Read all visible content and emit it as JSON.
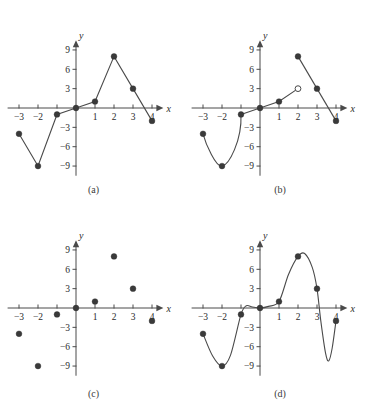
{
  "figure": {
    "background": "#ffffff",
    "marker_color": "#3a3a3a",
    "curve_color": "#4a4a4a",
    "axis_color": "#4a4a4a"
  },
  "axis": {
    "x_label": "x",
    "y_label": "y",
    "x_ticks": [
      "−3",
      "−2",
      "",
      "",
      "1",
      "2",
      "3",
      "4"
    ],
    "x_tick_values": [
      -3,
      -2,
      -1,
      0,
      1,
      2,
      3,
      4
    ],
    "y_ticks": [
      "9",
      "6",
      "3",
      "−3",
      "−6",
      "−9"
    ],
    "y_tick_values": [
      9,
      6,
      3,
      -3,
      -6,
      -9
    ],
    "xlim": [
      -3.6,
      4.6
    ],
    "ylim": [
      -10.5,
      10.5
    ],
    "grid": false
  },
  "panels": [
    {
      "id": "a",
      "caption": "(a)",
      "type": "line",
      "description": "points joined by straight line segments"
    },
    {
      "id": "b",
      "caption": "(b)",
      "type": "line",
      "description": "piecewise: smooth curve left, line to open circle, separate line segment right"
    },
    {
      "id": "c",
      "caption": "(c)",
      "type": "scatter",
      "description": "data points only, no connecting lines"
    },
    {
      "id": "d",
      "caption": "(d)",
      "type": "line",
      "description": "single smooth spline through all points"
    }
  ],
  "chart_data": [
    {
      "type": "line",
      "panel": "a",
      "title": "(a)",
      "xlabel": "x",
      "ylabel": "y",
      "x": [
        -3,
        -2,
        -1,
        0,
        1,
        2,
        3,
        4
      ],
      "values": [
        -4,
        -9,
        -1,
        0,
        1,
        8,
        3,
        -2
      ],
      "xlim": [
        -3.6,
        4.6
      ],
      "ylim": [
        -10.5,
        10.5
      ],
      "grid": false,
      "markers": true,
      "connected": true
    },
    {
      "type": "line",
      "panel": "b",
      "title": "(b)",
      "xlabel": "x",
      "ylabel": "y",
      "x": [
        -3,
        -2,
        -1,
        0,
        1,
        2,
        3,
        4
      ],
      "values": [
        -4,
        -9,
        -1,
        0,
        1,
        8,
        3,
        -2
      ],
      "xlim": [
        -3.6,
        4.6
      ],
      "ylim": [
        -10.5,
        10.5
      ],
      "grid": false,
      "markers": true,
      "connected": true,
      "open_circle": {
        "x": 2,
        "y": 3
      },
      "segments": [
        {
          "kind": "curve",
          "points": [
            [
              -3,
              -4
            ],
            [
              -2,
              -9
            ],
            [
              -1,
              -1
            ]
          ]
        },
        {
          "kind": "line",
          "points": [
            [
              -1,
              -1
            ],
            [
              0,
              0
            ],
            [
              1,
              1
            ],
            [
              2,
              3
            ]
          ]
        },
        {
          "kind": "line",
          "points": [
            [
              2,
              8
            ],
            [
              3,
              3
            ],
            [
              4,
              -2
            ]
          ]
        }
      ]
    },
    {
      "type": "scatter",
      "panel": "c",
      "title": "(c)",
      "xlabel": "x",
      "ylabel": "y",
      "x": [
        -3,
        -2,
        -1,
        0,
        1,
        2,
        3,
        4
      ],
      "values": [
        -4,
        -9,
        -1,
        0,
        1,
        8,
        3,
        -2
      ],
      "xlim": [
        -3.6,
        4.6
      ],
      "ylim": [
        -10.5,
        10.5
      ],
      "grid": false,
      "markers": true,
      "connected": false
    },
    {
      "type": "line",
      "panel": "d",
      "title": "(d)",
      "xlabel": "x",
      "ylabel": "y",
      "x": [
        -3,
        -2,
        -1,
        0,
        1,
        2,
        3,
        4
      ],
      "values": [
        -4,
        -9,
        -1,
        0,
        1,
        8,
        3,
        -2
      ],
      "xlim": [
        -3.6,
        4.6
      ],
      "ylim": [
        -10.5,
        10.5
      ],
      "grid": false,
      "markers": true,
      "connected": true,
      "smooth": true,
      "overshoots": [
        {
          "between": [
            3,
            4
          ],
          "min_y": -8.2
        },
        {
          "between": [
            2,
            3
          ],
          "max_y": 8.4
        }
      ]
    }
  ]
}
